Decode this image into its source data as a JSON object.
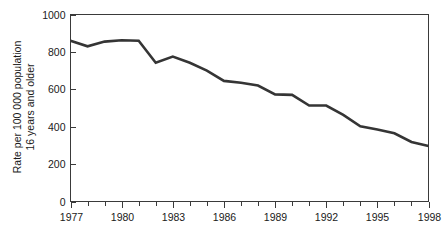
{
  "chart_data": {
    "type": "line",
    "title": "",
    "xlabel": "",
    "ylabel_line1": "Rate per 100 000 population",
    "ylabel_line2": "16 years and older",
    "ylim": [
      0,
      1000
    ],
    "yticks": [
      0,
      200,
      400,
      600,
      800,
      1000
    ],
    "ytick_labels": [
      "0",
      "200",
      "400",
      "600",
      "800",
      "1000"
    ],
    "xlim": [
      1977,
      1998
    ],
    "xticks": [
      1977,
      1978,
      1979,
      1980,
      1981,
      1982,
      1983,
      1984,
      1985,
      1986,
      1987,
      1988,
      1989,
      1990,
      1991,
      1992,
      1993,
      1994,
      1995,
      1996,
      1997,
      1998
    ],
    "xtick_labels_major": [
      "1977",
      "1980",
      "1983",
      "1986",
      "1989",
      "1992",
      "1995",
      "1998"
    ],
    "xticks_major": [
      1977,
      1980,
      1983,
      1986,
      1989,
      1992,
      1995,
      1998
    ],
    "grid": false,
    "legend": false,
    "series": [
      {
        "name": "Rate per 100 000 population 16 years and older",
        "color": "#353535",
        "x": [
          1977,
          1978,
          1979,
          1980,
          1981,
          1982,
          1983,
          1984,
          1985,
          1986,
          1987,
          1988,
          1989,
          1990,
          1991,
          1992,
          1993,
          1994,
          1995,
          1996,
          1997,
          1998
        ],
        "values": [
          860,
          830,
          855,
          862,
          860,
          742,
          775,
          742,
          700,
          645,
          635,
          620,
          573,
          570,
          513,
          513,
          463,
          402,
          385,
          365,
          318,
          297
        ]
      }
    ]
  },
  "axes": {
    "y_label_line1": "Rate per 100 000 population",
    "y_label_line2": "16 years and older"
  }
}
